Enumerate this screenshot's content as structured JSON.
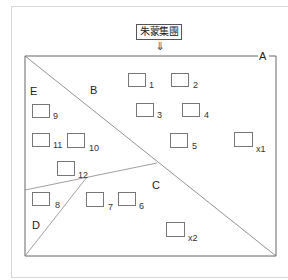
{
  "header": {
    "title": "朱蒙集團",
    "arrow": "⇓"
  },
  "colors": {
    "line": "#666666",
    "box_border": "#777777",
    "frame_border": "#d8d8d8"
  },
  "regions": {
    "A": "A",
    "B": "B",
    "C": "C",
    "D": "D",
    "E": "E"
  },
  "boxes": [
    {
      "id": "1",
      "label": "1"
    },
    {
      "id": "2",
      "label": "2"
    },
    {
      "id": "3",
      "label": "3"
    },
    {
      "id": "4",
      "label": "4"
    },
    {
      "id": "5",
      "label": "5"
    },
    {
      "id": "x1",
      "label": "x1"
    },
    {
      "id": "9",
      "label": "9"
    },
    {
      "id": "11",
      "label": "11"
    },
    {
      "id": "10",
      "label": "10"
    },
    {
      "id": "12",
      "label": "12"
    },
    {
      "id": "8",
      "label": "8"
    },
    {
      "id": "7",
      "label": "7"
    },
    {
      "id": "6",
      "label": "6"
    },
    {
      "id": "x2",
      "label": "x2"
    }
  ]
}
